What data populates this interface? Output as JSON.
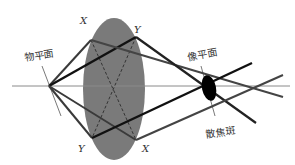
{
  "labels": {
    "object_plane": "物平面",
    "image_plane": "像平面",
    "blur_spot": "散焦斑",
    "x_top": "X",
    "y_top": "Y",
    "y_bottom": "Y",
    "x_bottom": "X"
  },
  "colors": {
    "lens": "#7a7a7a",
    "ray_dark": "#1a1a1a",
    "ray_gray": "#555555",
    "axis": "#888888",
    "blur_spot": "#000000"
  }
}
